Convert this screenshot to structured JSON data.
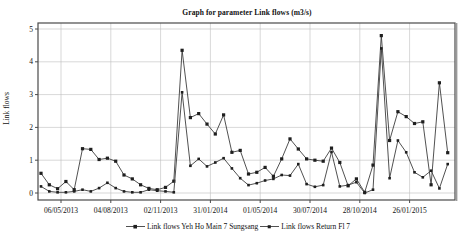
{
  "chart_data": {
    "type": "line",
    "title": "Graph for parameter Link flows (m3/s)",
    "ylabel": "Link flows",
    "xlabel": "",
    "ylim": [
      0,
      5
    ],
    "yticks": [
      0,
      1,
      2,
      3,
      4,
      5
    ],
    "x_tick_labels": [
      "06/05/2013",
      "04/08/2013",
      "02/11/2013",
      "31/01/2014",
      "01/05/2014",
      "30/07/2014",
      "28/10/2014",
      "26/01/2015"
    ],
    "x_tick_indices": [
      2.41,
      8.41,
      14.41,
      20.41,
      26.41,
      32.41,
      38.41,
      44.41
    ],
    "grid": true,
    "legend_position": "bottom",
    "series": [
      {
        "name": "Link flows Yeh Ho Main 7 Sungsang",
        "marker": "square",
        "marker_size": 3.2,
        "values": [
          0.6,
          0.25,
          0.13,
          0.35,
          0.1,
          1.35,
          1.33,
          1.02,
          1.06,
          0.97,
          0.55,
          0.43,
          0.25,
          0.14,
          0.1,
          0.17,
          0.36,
          4.35,
          2.3,
          2.42,
          2.1,
          1.8,
          2.38,
          1.24,
          1.3,
          0.58,
          0.63,
          0.78,
          0.51,
          1.04,
          1.65,
          1.34,
          1.04,
          1.0,
          0.97,
          1.37,
          0.93,
          0.22,
          0.43,
          0.02,
          0.85,
          4.8,
          1.6,
          2.48,
          2.33,
          2.12,
          2.17,
          0.25,
          3.36,
          1.23
        ]
      },
      {
        "name": "Link flows Return Fl 7",
        "marker": "square",
        "marker_size": 2.6,
        "values": [
          0.2,
          0.05,
          0.02,
          0.02,
          0.05,
          0.1,
          0.05,
          0.15,
          0.31,
          0.15,
          0.05,
          0.02,
          0.02,
          0.1,
          0.07,
          0.05,
          0.02,
          3.07,
          0.83,
          1.04,
          0.81,
          0.93,
          1.06,
          0.75,
          0.45,
          0.24,
          0.3,
          0.38,
          0.43,
          0.55,
          0.53,
          0.88,
          0.27,
          0.19,
          0.24,
          1.25,
          0.2,
          0.24,
          0.33,
          0.0,
          0.1,
          4.41,
          0.45,
          1.6,
          1.24,
          0.63,
          0.48,
          0.68,
          0.14,
          0.88
        ]
      }
    ],
    "colors": {
      "line": "#3d3d3d",
      "marker": "#1f1f1f",
      "grid": "#bdbdbd",
      "axis": "#4a4a4a",
      "text": "#111111",
      "background": "#ffffff"
    }
  }
}
